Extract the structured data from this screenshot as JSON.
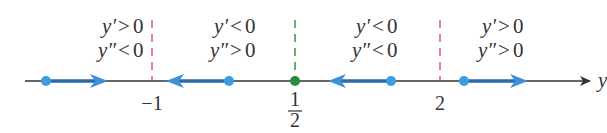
{
  "diagram": {
    "type": "phase-line",
    "axis_label": "y",
    "critical_points": [
      {
        "label": "−1",
        "color": "#d9536b",
        "type": "dashed-line"
      },
      {
        "label_num": "1",
        "label_den": "2",
        "color": "#2e8b3a",
        "type": "dashed-line-with-dot"
      },
      {
        "label": "2",
        "color": "#d9536b",
        "type": "dashed-line"
      }
    ],
    "regions": [
      {
        "first": {
          "var": "y′",
          "rel": ">",
          "val": "0"
        },
        "second": {
          "var": "y″",
          "rel": "<",
          "val": "0"
        },
        "arrow": "right"
      },
      {
        "first": {
          "var": "y′",
          "rel": "<",
          "val": "0"
        },
        "second": {
          "var": "y″",
          "rel": ">",
          "val": "0"
        },
        "arrow": "left"
      },
      {
        "first": {
          "var": "y′",
          "rel": "<",
          "val": "0"
        },
        "second": {
          "var": "y″",
          "rel": "<",
          "val": "0"
        },
        "arrow": "left"
      },
      {
        "first": {
          "var": "y′",
          "rel": ">",
          "val": "0"
        },
        "second": {
          "var": "y″",
          "rel": ">",
          "val": "0"
        },
        "arrow": "right"
      }
    ],
    "colors": {
      "axis": "#333333",
      "arrow": "#2b7bbd",
      "dot": "#3d9be0",
      "red_dash": "#d9536b",
      "green": "#2e8b3a"
    }
  }
}
